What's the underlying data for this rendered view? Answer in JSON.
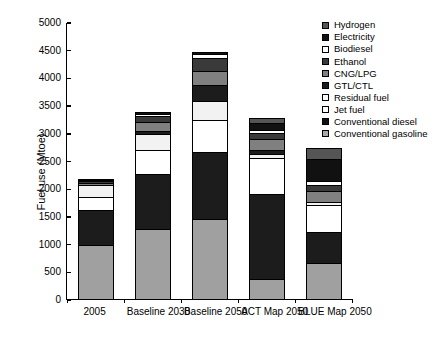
{
  "chart_data": {
    "type": "bar",
    "subtype": "stacked-bar",
    "title": "",
    "xlabel": "",
    "ylabel": "Fuel use (Mtoe)",
    "ylim": [
      0,
      5000
    ],
    "ytick_interval": 500,
    "yticks": [
      "5000",
      "4500",
      "4000",
      "3500",
      "3000",
      "2500",
      "2000",
      "1500",
      "1000",
      "500",
      "0"
    ],
    "grid": false,
    "legend_position": "top-right",
    "categories": [
      "2005",
      "Baseline 2030",
      "Baseline 2050",
      "ACT Map 2050",
      "BLUE Map 2050"
    ],
    "legend_order": [
      "Hydrogen",
      "Electricity",
      "Biodiesel",
      "Ethanol",
      "CNG/LPG",
      "GTL/CTL",
      "Residual fuel",
      "Jet fuel",
      "Conventional diesel",
      "Conventional gasoline"
    ],
    "stack_order_bottom_to_top": [
      "Conventional gasoline",
      "Conventional diesel",
      "Jet fuel",
      "Residual fuel",
      "GTL/CTL",
      "CNG/LPG",
      "Ethanol",
      "Biodiesel",
      "Electricity",
      "Hydrogen"
    ],
    "series": [
      {
        "name": "Conventional gasoline",
        "color": "#a0a0a0",
        "values": [
          960,
          1250,
          1430,
          340,
          640
        ]
      },
      {
        "name": "Conventional diesel",
        "color": "#1c1c1c",
        "values": [
          620,
          980,
          1200,
          1530,
          560
        ]
      },
      {
        "name": "Jet fuel",
        "color": "#ffffff",
        "values": [
          250,
          440,
          590,
          660,
          480
        ]
      },
      {
        "name": "Residual fuel",
        "color": "#f2f2f2",
        "values": [
          210,
          290,
          340,
          70,
          55
        ]
      },
      {
        "name": "GTL/CTL",
        "color": "#1c1c1c",
        "values": [
          0,
          60,
          290,
          80,
          0
        ]
      },
      {
        "name": "CNG/LPG",
        "color": "#808080",
        "values": [
          45,
          160,
          250,
          195,
          200
        ]
      },
      {
        "name": "Ethanol",
        "color": "#3a3a3a",
        "values": [
          25,
          110,
          230,
          110,
          110
        ]
      },
      {
        "name": "Biodiesel",
        "color": "#ffffff",
        "values": [
          5,
          30,
          70,
          45,
          60
        ]
      },
      {
        "name": "Electricity",
        "color": "#111111",
        "values": [
          20,
          30,
          40,
          130,
          400
        ]
      },
      {
        "name": "Hydrogen",
        "color": "#555555",
        "values": [
          0,
          0,
          0,
          90,
          205
        ]
      }
    ],
    "totals": [
      2135,
      3350,
      4440,
      3250,
      2710
    ]
  },
  "legend": {
    "items": [
      {
        "label": "Hydrogen",
        "color": "#555555"
      },
      {
        "label": "Electricity",
        "color": "#111111"
      },
      {
        "label": "Biodiesel",
        "color": "#ffffff"
      },
      {
        "label": "Ethanol",
        "color": "#3a3a3a"
      },
      {
        "label": "CNG/LPG",
        "color": "#808080"
      },
      {
        "label": "GTL/CTL",
        "color": "#1c1c1c"
      },
      {
        "label": "Residual fuel",
        "color": "#fbfbfb"
      },
      {
        "label": "Jet fuel",
        "color": "#ffffff"
      },
      {
        "label": "Conventional diesel",
        "color": "#111111"
      },
      {
        "label": "Conventional gasoline",
        "color": "#a8a8a8"
      }
    ]
  }
}
